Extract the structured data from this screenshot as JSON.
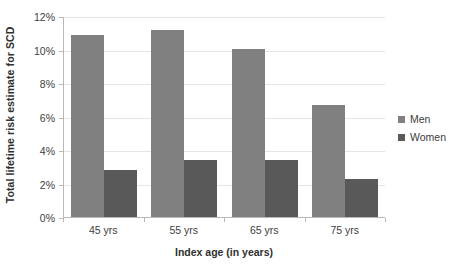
{
  "chart_data": {
    "type": "bar",
    "title": "",
    "xlabel": "Index age (in years)",
    "ylabel": "Total lifetime risk estimate for SCD",
    "categories": [
      "45 yrs",
      "55 yrs",
      "65 yrs",
      "75 yrs"
    ],
    "series": [
      {
        "name": "Men",
        "values": [
          10.9,
          11.2,
          10.1,
          6.7
        ],
        "color": "#808080"
      },
      {
        "name": "Women",
        "values": [
          2.8,
          3.4,
          3.4,
          2.3
        ],
        "color": "#595959"
      }
    ],
    "ylim": [
      0,
      12
    ],
    "ytick_labels": [
      "0%",
      "2%",
      "4%",
      "6%",
      "8%",
      "10%",
      "12%"
    ],
    "ytick_values": [
      0,
      2,
      4,
      6,
      8,
      10,
      12
    ],
    "grid": true,
    "grid_axis": "y",
    "legend_position": "right"
  },
  "legend": {
    "entries": [
      {
        "label": "Men"
      },
      {
        "label": "Women"
      }
    ]
  },
  "colors": {
    "men": "#808080",
    "women": "#595959",
    "axis": "#b8b8b8",
    "gridline": "#e4e4e4",
    "text": "#404040",
    "title_text": "#303030",
    "background": "#ffffff"
  }
}
